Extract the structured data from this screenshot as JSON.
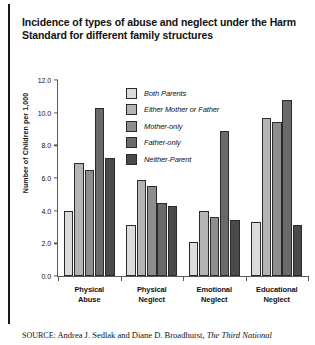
{
  "title": "Incidence of types of abuse and neglect under the Harm Standard for different family structures",
  "source": {
    "label": "SOURCE:",
    "text": "Andrea J. Sedlak and Diane D. Broadhurst,",
    "italic_tail": "The Third National"
  },
  "legend": {
    "position": "inside-top-center",
    "items": [
      {
        "label": "Both Parents",
        "color": "#dcdcdc"
      },
      {
        "label": "Either Mother or Father",
        "color": "#b4b4b4"
      },
      {
        "label": "Mother-only",
        "color": "#8e8e8e"
      },
      {
        "label": "Father-only",
        "color": "#6a6a6a"
      },
      {
        "label": "Neither-Parent",
        "color": "#4a4a4a"
      }
    ]
  },
  "chart_data": {
    "type": "bar",
    "title": "Incidence of types of abuse and neglect under the Harm Standard for different family structures",
    "xlabel": "",
    "ylabel": "Number of Children per 1,000",
    "ylim": [
      0.0,
      12.0
    ],
    "ytick_step": 2.0,
    "ytick_labels": [
      "0.0",
      "2.0",
      "4.0",
      "6.0",
      "8.0",
      "10.0",
      "12.0"
    ],
    "ytick_values": [
      0.0,
      2.0,
      4.0,
      6.0,
      8.0,
      10.0,
      12.0
    ],
    "grid": false,
    "categories": [
      "Physical Abuse",
      "Physical Neglect",
      "Emotional Neglect",
      "Educational Neglect"
    ],
    "category_lines": [
      [
        "Physical",
        "Abuse"
      ],
      [
        "Physical",
        "Neglect"
      ],
      [
        "Emotional",
        "Neglect"
      ],
      [
        "Educational",
        "Neglect"
      ]
    ],
    "series": [
      {
        "name": "Both Parents",
        "color": "#dcdcdc",
        "values": [
          4.0,
          3.1,
          2.1,
          3.3
        ]
      },
      {
        "name": "Either Mother or Father",
        "color": "#b4b4b4",
        "values": [
          6.9,
          5.9,
          4.0,
          9.7
        ]
      },
      {
        "name": "Mother-only",
        "color": "#8e8e8e",
        "values": [
          6.5,
          5.5,
          3.6,
          9.4
        ]
      },
      {
        "name": "Father-only",
        "color": "#6a6a6a",
        "values": [
          10.3,
          4.5,
          8.9,
          10.8
        ]
      },
      {
        "name": "Neither-Parent",
        "color": "#4a4a4a",
        "values": [
          7.2,
          4.3,
          3.4,
          3.1
        ]
      }
    ]
  }
}
